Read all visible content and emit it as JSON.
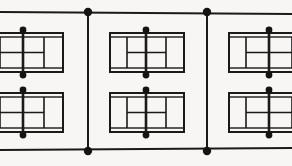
{
  "diagram": {
    "canvas": {
      "width": 292,
      "height": 166
    },
    "background_color": "#f7f6f4",
    "line_color": "#1a1a1a",
    "dot_color": "#141414"
  },
  "fences": {
    "horizontal": [
      {
        "name": "top-fence-line",
        "x1": 0,
        "y1": 12,
        "x2": 292,
        "y2": 14,
        "stroke_width": 2
      },
      {
        "name": "bottom-fence-line",
        "x1": 0,
        "y1": 150,
        "x2": 292,
        "y2": 148,
        "stroke_width": 2
      }
    ],
    "vertical": [
      {
        "name": "left-divider-fence",
        "x": 88,
        "y1": 13,
        "y2": 149,
        "stroke_width": 2
      },
      {
        "name": "right-divider-fence",
        "x": 207,
        "y1": 13,
        "y2": 149,
        "stroke_width": 2
      }
    ],
    "junction_dots": [
      {
        "name": "fence-junction-top-left",
        "cx": 88,
        "cy": 12,
        "r": 4.2
      },
      {
        "name": "fence-junction-top-right",
        "cx": 207,
        "cy": 12,
        "r": 4.2
      },
      {
        "name": "fence-junction-bottom-left",
        "cx": 88,
        "cy": 151,
        "r": 4.2
      },
      {
        "name": "fence-junction-bottom-right",
        "cx": 207,
        "cy": 151,
        "r": 4.2
      }
    ]
  },
  "courts": [
    {
      "name": "court-top-left",
      "row": 0,
      "column": 0,
      "clipped_edge": "left",
      "outer": {
        "x": -18,
        "y": 33,
        "width": 81,
        "height": 39
      },
      "inner": {
        "x": -18,
        "y": 37,
        "width": 81,
        "height": 31
      },
      "net": {
        "x": 23,
        "y1": 28,
        "y2": 77,
        "stroke_width": 2.6
      },
      "net_posts": [
        {
          "name": "net-post-top",
          "cx": 23,
          "cy": 30,
          "r": 3.4
        },
        {
          "name": "net-post-bottom",
          "cx": 23,
          "cy": 75,
          "r": 3.4
        }
      ],
      "service_lines": [
        {
          "name": "service-line-left",
          "x": 0,
          "y1": 37,
          "y2": 68
        },
        {
          "name": "service-line-right",
          "x": 44,
          "y1": 37,
          "y2": 68
        }
      ],
      "center_service_line": {
        "name": "center-service-line",
        "x1": 0,
        "y1": 52.5,
        "x2": 44,
        "y2": 52.5
      }
    },
    {
      "name": "court-top-middle",
      "row": 0,
      "column": 1,
      "clipped_edge": "none",
      "outer": {
        "x": 110,
        "y": 33,
        "width": 74,
        "height": 39
      },
      "inner": {
        "x": 110,
        "y": 37,
        "width": 74,
        "height": 31
      },
      "net": {
        "x": 146,
        "y1": 28,
        "y2": 77,
        "stroke_width": 2.6
      },
      "net_posts": [
        {
          "name": "net-post-top",
          "cx": 146,
          "cy": 30,
          "r": 3.4
        },
        {
          "name": "net-post-bottom",
          "cx": 146,
          "cy": 75,
          "r": 3.4
        }
      ],
      "service_lines": [
        {
          "name": "service-line-left",
          "x": 127,
          "y1": 37,
          "y2": 68
        },
        {
          "name": "service-line-right",
          "x": 166,
          "y1": 37,
          "y2": 68
        }
      ],
      "center_service_line": {
        "name": "center-service-line",
        "x1": 127,
        "y1": 52.5,
        "x2": 166,
        "y2": 52.5
      }
    },
    {
      "name": "court-top-right",
      "row": 0,
      "column": 2,
      "clipped_edge": "right",
      "outer": {
        "x": 229,
        "y": 33,
        "width": 81,
        "height": 39
      },
      "inner": {
        "x": 229,
        "y": 37,
        "width": 81,
        "height": 31
      },
      "net": {
        "x": 269,
        "y1": 28,
        "y2": 77,
        "stroke_width": 2.6
      },
      "net_posts": [
        {
          "name": "net-post-top",
          "cx": 269,
          "cy": 30,
          "r": 3.4
        },
        {
          "name": "net-post-bottom",
          "cx": 269,
          "cy": 75,
          "r": 3.4
        }
      ],
      "service_lines": [
        {
          "name": "service-line-left",
          "x": 246,
          "y1": 37,
          "y2": 68
        },
        {
          "name": "service-line-right",
          "x": 292,
          "y1": 37,
          "y2": 68
        }
      ],
      "center_service_line": {
        "name": "center-service-line",
        "x1": 246,
        "y1": 52.5,
        "x2": 292,
        "y2": 52.5
      }
    },
    {
      "name": "court-bottom-left",
      "row": 1,
      "column": 0,
      "clipped_edge": "left",
      "outer": {
        "x": -18,
        "y": 93,
        "width": 81,
        "height": 39
      },
      "inner": {
        "x": -18,
        "y": 97,
        "width": 81,
        "height": 31
      },
      "net": {
        "x": 23,
        "y1": 88,
        "y2": 137,
        "stroke_width": 2.6
      },
      "net_posts": [
        {
          "name": "net-post-top",
          "cx": 23,
          "cy": 90,
          "r": 3.4
        },
        {
          "name": "net-post-bottom",
          "cx": 23,
          "cy": 135,
          "r": 3.4
        }
      ],
      "service_lines": [
        {
          "name": "service-line-left",
          "x": 0,
          "y1": 97,
          "y2": 128
        },
        {
          "name": "service-line-right",
          "x": 44,
          "y1": 97,
          "y2": 128
        }
      ],
      "center_service_line": {
        "name": "center-service-line",
        "x1": 0,
        "y1": 112.5,
        "x2": 44,
        "y2": 112.5
      }
    },
    {
      "name": "court-bottom-middle",
      "row": 1,
      "column": 1,
      "clipped_edge": "none",
      "outer": {
        "x": 110,
        "y": 93,
        "width": 74,
        "height": 39
      },
      "inner": {
        "x": 110,
        "y": 97,
        "width": 74,
        "height": 31
      },
      "net": {
        "x": 146,
        "y1": 88,
        "y2": 137,
        "stroke_width": 2.6
      },
      "net_posts": [
        {
          "name": "net-post-top",
          "cx": 146,
          "cy": 90,
          "r": 3.4
        },
        {
          "name": "net-post-bottom",
          "cx": 146,
          "cy": 135,
          "r": 3.4
        }
      ],
      "service_lines": [
        {
          "name": "service-line-left",
          "x": 127,
          "y1": 97,
          "y2": 128
        },
        {
          "name": "service-line-right",
          "x": 166,
          "y1": 97,
          "y2": 128
        }
      ],
      "center_service_line": {
        "name": "center-service-line",
        "x1": 127,
        "y1": 112.5,
        "x2": 166,
        "y2": 112.5
      }
    },
    {
      "name": "court-bottom-right",
      "row": 1,
      "column": 2,
      "clipped_edge": "right",
      "outer": {
        "x": 229,
        "y": 93,
        "width": 81,
        "height": 39
      },
      "inner": {
        "x": 229,
        "y": 97,
        "width": 81,
        "height": 31
      },
      "net": {
        "x": 269,
        "y1": 88,
        "y2": 137,
        "stroke_width": 2.6
      },
      "net_posts": [
        {
          "name": "net-post-top",
          "cx": 269,
          "cy": 90,
          "r": 3.4
        },
        {
          "name": "net-post-bottom",
          "cx": 269,
          "cy": 135,
          "r": 3.4
        }
      ],
      "service_lines": [
        {
          "name": "service-line-left",
          "x": 246,
          "y1": 97,
          "y2": 128
        },
        {
          "name": "service-line-right",
          "x": 292,
          "y1": 97,
          "y2": 128
        }
      ],
      "center_service_line": {
        "name": "center-service-line",
        "x1": 246,
        "y1": 112.5,
        "x2": 292,
        "y2": 112.5
      }
    }
  ]
}
